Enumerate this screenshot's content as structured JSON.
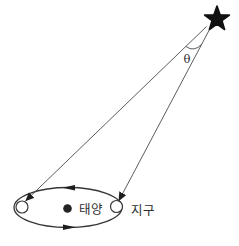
{
  "figure": {
    "type": "stellar-parallax-diagram",
    "labels": {
      "sun": "태양",
      "earth": "지구",
      "angle": "θ"
    },
    "icons": {
      "star": "star-icon",
      "sun": "sun-dot-icon",
      "earth_left": "earth-position-left-circle",
      "earth_right": "earth-position-right-circle",
      "orbit_arrows": "orbit-direction-arrow-icon"
    },
    "colors": {
      "ink": "#111111",
      "line": "#4a4a4a",
      "orbit": "#373737",
      "text": "#2e2e2e",
      "background": "#ffffff"
    }
  }
}
